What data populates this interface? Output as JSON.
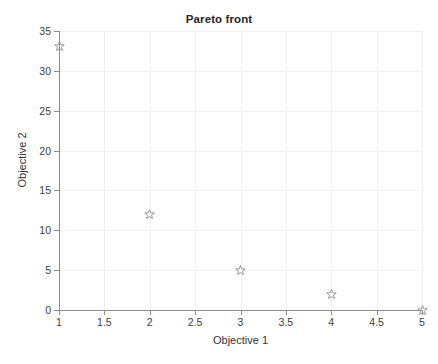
{
  "chart_data": {
    "type": "scatter",
    "title": "Pareto front",
    "xlabel": "Objective 1",
    "ylabel": "Objective 2",
    "xlim": [
      1,
      5
    ],
    "ylim": [
      0,
      35
    ],
    "grid": true,
    "legend": null,
    "marker_style": "pentagram",
    "marker_color": "#8c8c8c",
    "xticks": [
      "1",
      "1.5",
      "2",
      "2.5",
      "3",
      "3.5",
      "4",
      "4.5",
      "5"
    ],
    "xtick_values": [
      1,
      1.5,
      2,
      2.5,
      3,
      3.5,
      4,
      4.5,
      5
    ],
    "yticks": [
      "0",
      "5",
      "10",
      "15",
      "20",
      "25",
      "30",
      "35"
    ],
    "ytick_values": [
      0,
      5,
      10,
      15,
      20,
      25,
      30,
      35
    ],
    "series": [
      {
        "name": "Pareto front",
        "x": [
          1,
          2,
          3,
          4,
          5
        ],
        "y": [
          33,
          12,
          5,
          2,
          0
        ]
      }
    ],
    "points": [
      {
        "x": 1,
        "y": 33
      },
      {
        "x": 2,
        "y": 12
      },
      {
        "x": 3,
        "y": 5
      },
      {
        "x": 4,
        "y": 2
      },
      {
        "x": 5,
        "y": 0
      }
    ]
  },
  "colors": {
    "axis": "#8c8c8c",
    "grid": "#f0f0f0",
    "marker": "#8c8c8c",
    "text": "#333333",
    "background": "#ffffff"
  }
}
